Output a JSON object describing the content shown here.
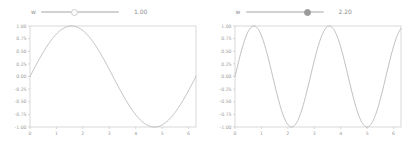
{
  "panels": [
    {
      "slider": {
        "label": "w",
        "value_text": "1.00",
        "value": 1.0,
        "min": 0.1,
        "max": 3.0,
        "handle_style": "hollow",
        "handle_pct": 43
      },
      "chart_data": {
        "type": "line",
        "title": "",
        "xlabel": "",
        "ylabel": "",
        "expression": "sin(1.00 * x)",
        "frequency": 1.0,
        "xlim": [
          0,
          6.283185
        ],
        "ylim": [
          -1.0,
          1.0
        ],
        "xticks": [
          "0",
          "1",
          "2",
          "3",
          "4",
          "5",
          "6"
        ],
        "xtick_values": [
          0,
          1,
          2,
          3,
          4,
          5,
          6
        ],
        "yticks": [
          "1.00",
          "0.75",
          "0.50",
          "0.25",
          "0.00",
          "-0.25",
          "-0.50",
          "-0.75",
          "-1.00"
        ],
        "ytick_values": [
          1.0,
          0.75,
          0.5,
          0.25,
          0.0,
          -0.25,
          -0.5,
          -0.75,
          -1.0
        ],
        "grid": false,
        "legend": null,
        "line_color": "#a9a9a9",
        "series": [
          {
            "name": "sin(1.00x)",
            "x": [
              0.0,
              0.314,
              0.628,
              0.942,
              1.257,
              1.571,
              1.885,
              2.199,
              2.513,
              2.827,
              3.142,
              3.456,
              3.77,
              4.084,
              4.398,
              4.712,
              5.027,
              5.341,
              5.655,
              5.969,
              6.283
            ],
            "values": [
              0.0,
              0.309,
              0.588,
              0.809,
              0.951,
              1.0,
              0.951,
              0.809,
              0.588,
              0.309,
              0.0,
              -0.309,
              -0.588,
              -0.809,
              -0.951,
              -1.0,
              -0.951,
              -0.809,
              -0.588,
              -0.309,
              0.0
            ]
          }
        ]
      }
    },
    {
      "slider": {
        "label": "w",
        "value_text": "2.20",
        "value": 2.2,
        "min": 0.1,
        "max": 3.0,
        "handle_style": "filled",
        "handle_pct": 80
      },
      "chart_data": {
        "type": "line",
        "title": "",
        "xlabel": "",
        "ylabel": "",
        "expression": "sin(2.20 * x)",
        "frequency": 2.2,
        "xlim": [
          0,
          6.283185
        ],
        "ylim": [
          -1.0,
          1.0
        ],
        "xticks": [
          "0",
          "1",
          "2",
          "3",
          "4",
          "5",
          "6"
        ],
        "xtick_values": [
          0,
          1,
          2,
          3,
          4,
          5,
          6
        ],
        "yticks": [
          "1.00",
          "0.75",
          "0.50",
          "0.25",
          "0.00",
          "-0.25",
          "-0.50",
          "-0.75",
          "-1.00"
        ],
        "ytick_values": [
          1.0,
          0.75,
          0.5,
          0.25,
          0.0,
          -0.25,
          -0.5,
          -0.75,
          -1.0
        ],
        "grid": false,
        "legend": null,
        "line_color": "#a9a9a9",
        "series": [
          {
            "name": "sin(2.20x)",
            "x": [
              0.0,
              0.314,
              0.628,
              0.942,
              1.257,
              1.571,
              1.885,
              2.199,
              2.513,
              2.827,
              3.142,
              3.456,
              3.77,
              4.084,
              4.398,
              4.712,
              5.027,
              5.341,
              5.655,
              5.969,
              6.283
            ],
            "values": [
              0.0,
              0.634,
              0.982,
              0.91,
              0.455,
              -0.174,
              -0.718,
              -0.998,
              -0.916,
              -0.508,
              0.105,
              0.679,
              0.995,
              0.891,
              0.405,
              -0.233,
              -0.756,
              -0.999,
              -0.883,
              -0.445,
              0.203
            ]
          }
        ]
      }
    }
  ],
  "style": {
    "axis_color": "#c8c8c8",
    "tick_color": "#9b9b9b",
    "background": "#ffffff"
  }
}
